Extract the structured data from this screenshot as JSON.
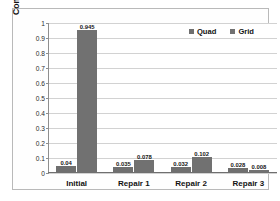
{
  "chart_data": {
    "type": "bar",
    "title": "",
    "subtitle": "",
    "xlabel": "",
    "ylabel": "Computation Time [s]",
    "categories": [
      "Initial",
      "Repair 1",
      "Repair 2",
      "Repair 3"
    ],
    "series": [
      {
        "name": "Quad",
        "color": "#6f6f6f",
        "values": [
          0.04,
          0.035,
          0.032,
          0.028
        ]
      },
      {
        "name": "Grid",
        "color": "#717171",
        "values": [
          0.945,
          0.078,
          0.102,
          0.008
        ]
      }
    ],
    "value_labels": [
      [
        "0.04",
        "0.035",
        "0.032",
        "0.028"
      ],
      [
        "0.945",
        "0.078",
        "0.102",
        "0.008"
      ]
    ],
    "ylim": [
      0,
      1
    ],
    "ytick_values": [
      0,
      0.1,
      0.2,
      0.3,
      0.4,
      0.5,
      0.6,
      0.7,
      0.8,
      0.9,
      1
    ],
    "ytick_labels": [
      "0",
      "0.1",
      "0.2",
      "0.3",
      "0.4",
      "0.5",
      "0.6",
      "0.7",
      "0.8",
      "0.9",
      "1"
    ],
    "grid": true,
    "grid_axis": "y",
    "legend_position": "top-right",
    "legend_orientation": "horizontal",
    "data_labels_shown": true,
    "plot_background": "#ffffff",
    "frame_color": "#b9b9b9"
  }
}
